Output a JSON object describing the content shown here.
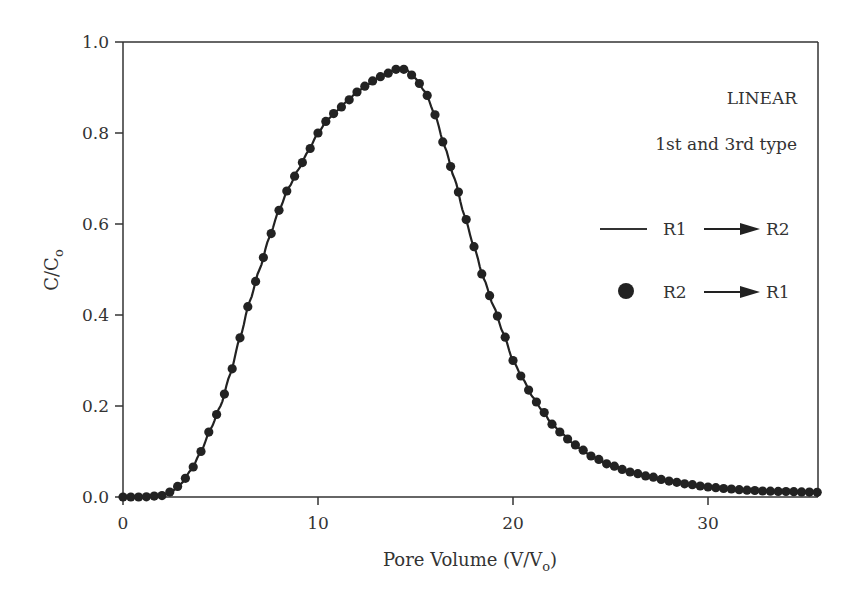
{
  "chart_data": {
    "type": "line",
    "title": "",
    "xlabel": "Pore Volume (V/V",
    "xlabel_sub": "o",
    "xlabel_close": ")",
    "ylabel": "C/C",
    "ylabel_sub": "o",
    "xlim": [
      0,
      36
    ],
    "ylim": [
      0,
      1.0
    ],
    "xticks": [
      0,
      10,
      20,
      30
    ],
    "xtick_labels": [
      "0",
      "10",
      "20",
      "30"
    ],
    "yticks": [
      0.0,
      0.2,
      0.4,
      0.6,
      0.8,
      1.0
    ],
    "ytick_labels": [
      "0.0",
      "0.2",
      "0.4",
      "0.6",
      "0.8",
      "1.0"
    ],
    "grid": false,
    "annotations": [
      "LINEAR",
      "1st and 3rd type"
    ],
    "legend": {
      "position": "right",
      "entries": [
        {
          "marker": "line",
          "from": "R1",
          "to": "R2"
        },
        {
          "marker": "dot",
          "from": "R2",
          "to": "R1"
        }
      ]
    },
    "series": [
      {
        "name": "R1 → R2",
        "style": "line",
        "x": [
          0,
          1,
          2,
          2.5,
          3,
          3.5,
          4,
          4.5,
          5,
          5.5,
          6,
          6.5,
          7,
          7.5,
          8,
          8.5,
          9,
          9.5,
          10,
          10.5,
          11,
          11.5,
          12,
          12.5,
          13,
          13.5,
          14,
          14.5,
          15,
          15.5,
          16,
          16.5,
          17,
          17.5,
          18,
          18.5,
          19,
          19.5,
          20,
          20.5,
          21,
          21.5,
          22,
          22.5,
          23,
          23.5,
          24,
          25,
          26,
          27,
          28,
          29,
          30,
          31,
          32,
          33,
          34,
          35,
          36
        ],
        "values": [
          0.0,
          0.0,
          0.003,
          0.012,
          0.03,
          0.06,
          0.1,
          0.15,
          0.2,
          0.27,
          0.35,
          0.43,
          0.5,
          0.57,
          0.63,
          0.68,
          0.72,
          0.76,
          0.8,
          0.83,
          0.85,
          0.87,
          0.89,
          0.905,
          0.92,
          0.93,
          0.94,
          0.94,
          0.92,
          0.89,
          0.84,
          0.77,
          0.7,
          0.62,
          0.55,
          0.48,
          0.42,
          0.36,
          0.3,
          0.26,
          0.22,
          0.19,
          0.16,
          0.14,
          0.12,
          0.105,
          0.09,
          0.07,
          0.055,
          0.045,
          0.035,
          0.028,
          0.022,
          0.018,
          0.015,
          0.013,
          0.012,
          0.011,
          0.01
        ]
      },
      {
        "name": "R2 → R1",
        "style": "dots",
        "x_step": 0.4,
        "note": "dots follow the same curve as R1 → R2"
      }
    ],
    "colors": {
      "line": "#222222",
      "dots": "#222222",
      "axes": "#333333"
    }
  }
}
